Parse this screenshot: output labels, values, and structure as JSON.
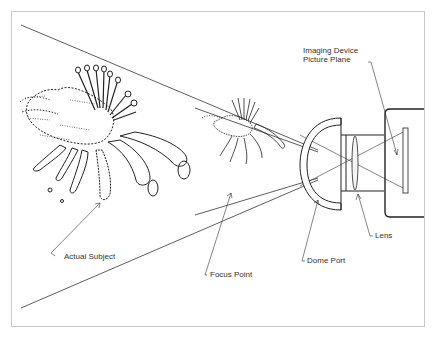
{
  "diagram": {
    "labels": {
      "imaging_device_line1": "Imaging Device",
      "imaging_device_line2": "Picture Plane",
      "lens": "Lens",
      "dome_port": "Dome Port",
      "focus_point": "Focus Point",
      "actual_subject": "Actual Subject"
    },
    "components": [
      "Actual Subject",
      "Focus Point (virtual image)",
      "Dome Port",
      "Lens",
      "Imaging Device Picture Plane"
    ],
    "colors": {
      "line": "#333333",
      "frame": "#c8c8c8",
      "background": "#ffffff"
    }
  }
}
